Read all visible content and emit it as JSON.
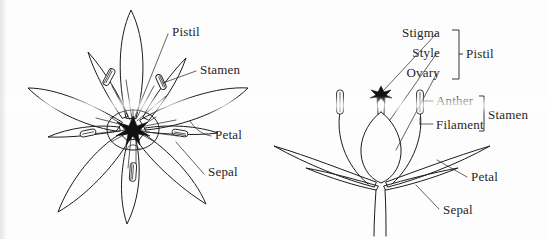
{
  "figure": {
    "background_color": "#fdfdfd",
    "ink_color": "#1c1c1c",
    "label_color": "#262626"
  },
  "left_diagram": {
    "name": "face-view-flower",
    "description": "Top-down view of a six-petaled flower showing pistil, stamens, petals and sepals",
    "labels": [
      {
        "id": "pistil",
        "text": "Pistil",
        "x": 172,
        "y": 36
      },
      {
        "id": "stamen",
        "text": "Stamen",
        "x": 200,
        "y": 74
      },
      {
        "id": "petal",
        "text": "Petal",
        "x": 215,
        "y": 139
      },
      {
        "id": "sepal",
        "text": "Sepal",
        "x": 208,
        "y": 176
      }
    ]
  },
  "right_diagram": {
    "name": "side-section-flower",
    "description": "Longitudinal section of a flower showing stigma, style, ovary, anther, filament, petal and sepal",
    "labels": [
      {
        "id": "stigma",
        "text": "Stigma",
        "x": 440,
        "y": 37
      },
      {
        "id": "style",
        "text": "Style",
        "x": 440,
        "y": 57
      },
      {
        "id": "ovary",
        "text": "Ovary",
        "x": 440,
        "y": 77
      },
      {
        "id": "pistil",
        "text": "Pistil",
        "x": 466,
        "y": 57
      },
      {
        "id": "anther",
        "text": "Anther",
        "x": 436,
        "y": 104
      },
      {
        "id": "filament",
        "text": "Filament",
        "x": 436,
        "y": 128
      },
      {
        "id": "stamen",
        "text": "Stamen",
        "x": 490,
        "y": 118
      },
      {
        "id": "petal",
        "text": "Petal",
        "x": 471,
        "y": 180
      },
      {
        "id": "sepal",
        "text": "Sepal",
        "x": 443,
        "y": 212
      }
    ]
  }
}
